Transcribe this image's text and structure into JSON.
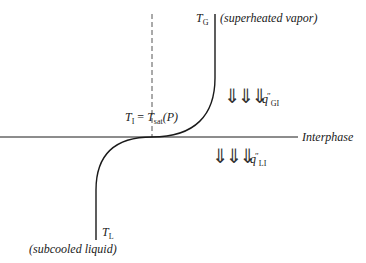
{
  "diagram": {
    "labels": {
      "T_G": {
        "main": "T",
        "sub": "G"
      },
      "superheated_vapor": "(superheated vapor)",
      "T_I": {
        "main": "T",
        "sub": "I",
        "equals": " = ",
        "rhs_main": "T",
        "rhs_sub": "sat",
        "rhs_arg": "(P)"
      },
      "interphase": "Interphase",
      "T_L": {
        "main": "T",
        "sub": "L"
      },
      "subcooled_liquid": "(subcooled liquid)",
      "q_GI": {
        "main": "q",
        "sup": "″",
        "sub": "GI"
      },
      "q_LI": {
        "main": "q",
        "sup": "″",
        "sub": "LI"
      }
    },
    "arrows": {
      "upper": "⇓⇓⇓",
      "lower": "⇓⇓⇓"
    },
    "colors": {
      "line": "#1a1a1a",
      "dashed": "#555555",
      "background": "#ffffff"
    }
  }
}
